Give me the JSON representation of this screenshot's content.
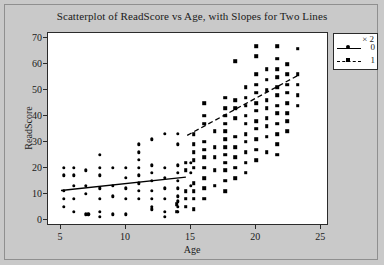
{
  "chart_data": {
    "type": "scatter",
    "title": "Scatterplot of ReadScore vs Age, with Slopes for Two Lines",
    "xlabel": "Age",
    "ylabel": "ReadScore",
    "xlim": [
      4,
      25.6
    ],
    "ylim": [
      -2.5,
      72
    ],
    "xticks": [
      5,
      10,
      15,
      20,
      25
    ],
    "yticks": [
      0,
      10,
      20,
      30,
      40,
      50,
      60,
      70
    ],
    "grid": false,
    "legend": {
      "title": "× 2",
      "position": "top-right-outside",
      "entries": [
        {
          "label": "0",
          "marker": "circle",
          "line": "solid"
        },
        {
          "label": "1",
          "marker": "square",
          "line": "dashed"
        }
      ]
    },
    "series": [
      {
        "name": "0",
        "marker": "circle",
        "line": "solid",
        "color": "#000000",
        "fit_line": {
          "x": [
            5.0,
            14.6
          ],
          "y": [
            11.2,
            16.4
          ]
        },
        "points": [
          [
            5.2,
            20
          ],
          [
            5.2,
            17
          ],
          [
            5.2,
            11
          ],
          [
            5.2,
            8
          ],
          [
            5.2,
            5
          ],
          [
            6.0,
            20
          ],
          [
            6.0,
            17
          ],
          [
            6.0,
            13
          ],
          [
            6.0,
            8
          ],
          [
            6.0,
            3
          ],
          [
            6.9,
            19
          ],
          [
            6.9,
            13
          ],
          [
            6.9,
            10
          ],
          [
            6.9,
            2
          ],
          [
            7.1,
            2
          ],
          [
            8.0,
            25
          ],
          [
            8.0,
            20
          ],
          [
            8.0,
            17
          ],
          [
            8.0,
            12
          ],
          [
            8.0,
            8
          ],
          [
            8.0,
            3
          ],
          [
            8.0,
            1
          ],
          [
            9.0,
            20
          ],
          [
            9.0,
            13
          ],
          [
            9.0,
            9
          ],
          [
            9.0,
            2
          ],
          [
            10.0,
            20
          ],
          [
            10.0,
            16
          ],
          [
            10.0,
            12
          ],
          [
            10.0,
            8
          ],
          [
            10.0,
            2
          ],
          [
            11.0,
            29
          ],
          [
            11.0,
            26
          ],
          [
            11.0,
            23
          ],
          [
            11.0,
            20
          ],
          [
            11.0,
            17
          ],
          [
            11.0,
            14
          ],
          [
            11.0,
            11
          ],
          [
            11.0,
            8
          ],
          [
            12.0,
            31
          ],
          [
            12.0,
            21
          ],
          [
            12.0,
            18
          ],
          [
            12.0,
            15
          ],
          [
            12.0,
            11
          ],
          [
            12.0,
            8
          ],
          [
            12.0,
            5
          ],
          [
            12.0,
            4
          ],
          [
            13.0,
            33
          ],
          [
            13.0,
            20
          ],
          [
            13.0,
            16
          ],
          [
            13.0,
            12
          ],
          [
            13.0,
            8
          ],
          [
            13.0,
            3
          ],
          [
            13.0,
            1
          ],
          [
            14.0,
            33
          ],
          [
            14.0,
            29
          ],
          [
            14.0,
            21
          ],
          [
            14.0,
            18
          ],
          [
            14.0,
            15
          ],
          [
            14.0,
            12
          ],
          [
            14.0,
            9
          ],
          [
            14.0,
            7
          ],
          [
            14.0,
            5
          ],
          [
            14.0,
            3
          ],
          [
            15.0,
            22
          ],
          [
            15.0,
            18
          ],
          [
            15.0,
            13
          ]
        ]
      },
      {
        "name": "1",
        "marker": "square",
        "line": "dashed",
        "color": "#000000",
        "fit_line": {
          "x": [
            14.7,
            23.2
          ],
          "y": [
            32.5,
            55.6
          ]
        },
        "points": [
          [
            13.9,
            3
          ],
          [
            13.9,
            6
          ],
          [
            14.6,
            22
          ],
          [
            14.6,
            19
          ],
          [
            14.6,
            11
          ],
          [
            14.6,
            8
          ],
          [
            14.6,
            5
          ],
          [
            15.2,
            33
          ],
          [
            15.2,
            29
          ],
          [
            15.2,
            26
          ],
          [
            15.2,
            23
          ],
          [
            15.2,
            20
          ],
          [
            15.2,
            14
          ],
          [
            15.2,
            11
          ],
          [
            15.2,
            8
          ],
          [
            15.2,
            4
          ],
          [
            16.0,
            45
          ],
          [
            16.0,
            40
          ],
          [
            16.0,
            37
          ],
          [
            16.0,
            30
          ],
          [
            16.0,
            27
          ],
          [
            16.0,
            24
          ],
          [
            16.0,
            20
          ],
          [
            16.0,
            16
          ],
          [
            16.0,
            12
          ],
          [
            16.0,
            8
          ],
          [
            16.8,
            34
          ],
          [
            16.8,
            28
          ],
          [
            16.8,
            24
          ],
          [
            16.8,
            19
          ],
          [
            16.8,
            13
          ],
          [
            17.6,
            47
          ],
          [
            17.6,
            43
          ],
          [
            17.6,
            40
          ],
          [
            17.6,
            37
          ],
          [
            17.6,
            34
          ],
          [
            17.6,
            31
          ],
          [
            17.6,
            28
          ],
          [
            17.6,
            25
          ],
          [
            17.6,
            22
          ],
          [
            17.6,
            19
          ],
          [
            17.6,
            15
          ],
          [
            17.6,
            11
          ],
          [
            18.4,
            61
          ],
          [
            18.4,
            46
          ],
          [
            18.4,
            43
          ],
          [
            18.4,
            39
          ],
          [
            18.4,
            32
          ],
          [
            18.4,
            28
          ],
          [
            18.4,
            24
          ],
          [
            18.4,
            20
          ],
          [
            18.4,
            16
          ],
          [
            19.2,
            51
          ],
          [
            19.2,
            47
          ],
          [
            19.2,
            44
          ],
          [
            19.2,
            40
          ],
          [
            19.2,
            37
          ],
          [
            19.2,
            33
          ],
          [
            19.2,
            30
          ],
          [
            19.2,
            26
          ],
          [
            19.2,
            22
          ],
          [
            19.2,
            18
          ],
          [
            20.0,
            67
          ],
          [
            20.0,
            63
          ],
          [
            20.0,
            56
          ],
          [
            20.0,
            52
          ],
          [
            20.0,
            49
          ],
          [
            20.0,
            45
          ],
          [
            20.0,
            42
          ],
          [
            20.0,
            38
          ],
          [
            20.0,
            35
          ],
          [
            20.0,
            31
          ],
          [
            20.0,
            27
          ],
          [
            20.0,
            23
          ],
          [
            20.8,
            58
          ],
          [
            20.8,
            54
          ],
          [
            20.8,
            50
          ],
          [
            20.8,
            46
          ],
          [
            20.8,
            43
          ],
          [
            20.8,
            39
          ],
          [
            20.8,
            36
          ],
          [
            20.8,
            32
          ],
          [
            20.8,
            26
          ],
          [
            21.6,
            67
          ],
          [
            21.6,
            62
          ],
          [
            21.6,
            58
          ],
          [
            21.6,
            55
          ],
          [
            21.6,
            51
          ],
          [
            21.6,
            48
          ],
          [
            21.6,
            44
          ],
          [
            21.6,
            41
          ],
          [
            21.6,
            37
          ],
          [
            21.6,
            33
          ],
          [
            21.6,
            29
          ],
          [
            21.6,
            25
          ],
          [
            22.4,
            60
          ],
          [
            22.4,
            56
          ],
          [
            22.4,
            52
          ],
          [
            22.4,
            49
          ],
          [
            22.4,
            45
          ],
          [
            22.4,
            41
          ],
          [
            22.4,
            38
          ],
          [
            22.4,
            34
          ],
          [
            23.2,
            66
          ],
          [
            23.2,
            56
          ],
          [
            23.2,
            52
          ],
          [
            23.2,
            48
          ],
          [
            23.2,
            44
          ]
        ]
      }
    ]
  }
}
